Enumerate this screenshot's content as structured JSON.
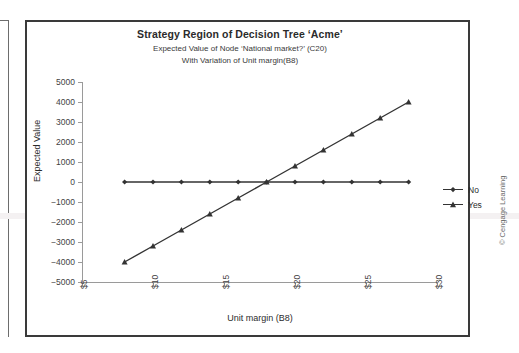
{
  "figure": {
    "copyright": "© Cengage Learning"
  },
  "chart_data": {
    "type": "line",
    "title": "Strategy Region of Decision Tree ‘Acme’",
    "subtitle_1": "Expected Value of Node ‘National market?’ (C20)",
    "subtitle_2": "With Variation of Unit margin(B8)",
    "xlabel": "Unit margin (B8)",
    "ylabel": "Expected Value",
    "x": [
      8,
      10,
      12,
      14,
      16,
      18,
      20,
      22,
      24,
      26,
      28
    ],
    "xlim": [
      5,
      30
    ],
    "ylim": [
      -5000,
      5000
    ],
    "xticks": [
      5,
      10,
      15,
      20,
      25,
      30
    ],
    "xtick_labels": [
      "$5",
      "$10",
      "$15",
      "$20",
      "$25",
      "$30"
    ],
    "yticks": [
      -5000,
      -4000,
      -3000,
      -2000,
      -1000,
      0,
      1000,
      2000,
      3000,
      4000,
      5000
    ],
    "ytick_labels": [
      "−5000",
      "−4000",
      "−3000",
      "−2000",
      "−1000",
      "0",
      "1000",
      "2000",
      "3000",
      "4000",
      "5000"
    ],
    "grid": false,
    "legend_position": "right",
    "series": [
      {
        "name": "No",
        "marker": "diamond",
        "color": "#333333",
        "values": [
          0,
          0,
          0,
          0,
          0,
          0,
          0,
          0,
          0,
          0,
          0
        ]
      },
      {
        "name": "Yes",
        "marker": "triangle",
        "color": "#333333",
        "values": [
          -4000,
          -3200,
          -2400,
          -1600,
          -800,
          0,
          800,
          1600,
          2400,
          3200,
          4000
        ]
      }
    ]
  }
}
